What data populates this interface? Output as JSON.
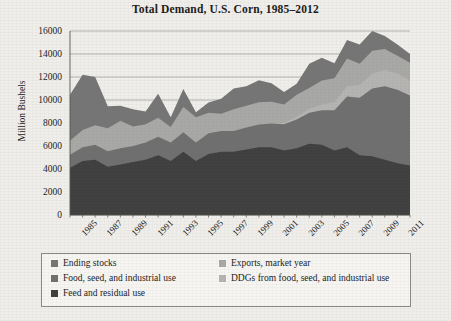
{
  "figure": {
    "title": "Total Demand, U.S. Corn, 1985–2012",
    "ylabel": "Million Bushels",
    "background_color": "#efeeea",
    "frame_color": "#8b8b86"
  },
  "chart_data": {
    "type": "area",
    "stacked": true,
    "title": "Total Demand, U.S. Corn, 1985–2012",
    "xlabel": "",
    "ylabel": "Million Bushels",
    "ylim": [
      0,
      16000
    ],
    "ytick_step": 2000,
    "yticks": [
      "0",
      "2000",
      "4000",
      "6000",
      "8000",
      "10000",
      "12000",
      "14000",
      "16000"
    ],
    "grid": "horizontal",
    "legend_position": "bottom",
    "legend_columns": 2,
    "x": [
      1985,
      1986,
      1987,
      1988,
      1989,
      1990,
      1991,
      1992,
      1993,
      1994,
      1995,
      1996,
      1997,
      1998,
      1999,
      2000,
      2001,
      2002,
      2003,
      2004,
      2005,
      2006,
      2007,
      2008,
      2009,
      2010,
      2011,
      2012
    ],
    "xticks": [
      "1985",
      "1987",
      "1989",
      "1991",
      "1993",
      "1995",
      "1997",
      "1999",
      "2001",
      "2003",
      "2005",
      "2007",
      "2009",
      "2011"
    ],
    "series": [
      {
        "name": "Feed and residual use",
        "color": "#3f3f3f",
        "stack_order": 1,
        "values": [
          4100,
          4700,
          4800,
          4200,
          4400,
          4600,
          4800,
          5200,
          4700,
          5500,
          4700,
          5300,
          5500,
          5500,
          5700,
          5900,
          5900,
          5600,
          5800,
          6200,
          6100,
          5600,
          5900,
          5200,
          5100,
          4800,
          4500,
          4300
        ]
      },
      {
        "name": "Food, seed, and industrial use",
        "color": "#6f6f6f",
        "stack_order": 2,
        "values": [
          1150,
          1200,
          1300,
          1350,
          1400,
          1400,
          1500,
          1600,
          1600,
          1700,
          1600,
          1800,
          1800,
          1800,
          1900,
          1960,
          2050,
          2300,
          2500,
          2700,
          3000,
          3500,
          4400,
          5000,
          5900,
          6400,
          6400,
          6100
        ]
      },
      {
        "name": "DDGs from food, seed, and industrial use",
        "color": "#b4b4b2",
        "stack_order": 3,
        "values": [
          0,
          0,
          0,
          0,
          0,
          0,
          0,
          0,
          0,
          0,
          0,
          0,
          0,
          0,
          0,
          0,
          0,
          100,
          250,
          350,
          500,
          700,
          900,
          1100,
          1300,
          1400,
          1400,
          1300
        ]
      },
      {
        "name": "Exports, market year",
        "color": "#a8a8a6",
        "stack_order": 4,
        "values": [
          1200,
          1500,
          1700,
          2000,
          2400,
          1700,
          1600,
          1650,
          1350,
          2200,
          2200,
          1800,
          1500,
          1900,
          1900,
          1950,
          1900,
          1600,
          1900,
          1800,
          2100,
          2100,
          2400,
          1850,
          1980,
          1830,
          1540,
          1540
        ]
      },
      {
        "name": "Ending stocks",
        "color": "#757575",
        "stack_order": 5,
        "values": [
          4000,
          4800,
          4200,
          1900,
          1300,
          1500,
          1100,
          2100,
          850,
          1550,
          425,
          880,
          1300,
          1800,
          1700,
          1900,
          1600,
          1100,
          960,
          2110,
          1970,
          1300,
          1620,
          1670,
          1710,
          1130,
          990,
          760
        ]
      }
    ]
  },
  "yticks": [
    {
      "label": "16000",
      "value": 16000
    },
    {
      "label": "14000",
      "value": 14000
    },
    {
      "label": "12000",
      "value": 12000
    },
    {
      "label": "10000",
      "value": 10000
    },
    {
      "label": "8000",
      "value": 8000
    },
    {
      "label": "6000",
      "value": 6000
    },
    {
      "label": "4000",
      "value": 4000
    },
    {
      "label": "2000",
      "value": 2000
    },
    {
      "label": "0",
      "value": 0
    }
  ],
  "xticks": [
    {
      "label": "1985"
    },
    {
      "label": "1987"
    },
    {
      "label": "1989"
    },
    {
      "label": "1991"
    },
    {
      "label": "1993"
    },
    {
      "label": "1995"
    },
    {
      "label": "1997"
    },
    {
      "label": "1999"
    },
    {
      "label": "2001"
    },
    {
      "label": "2003"
    },
    {
      "label": "2005"
    },
    {
      "label": "2007"
    },
    {
      "label": "2009"
    },
    {
      "label": "2011"
    }
  ],
  "legend": {
    "items": [
      {
        "label": "Ending stocks",
        "color": "#757575",
        "column": 0,
        "row": 0
      },
      {
        "label": "Exports, market year",
        "color": "#a8a8a6",
        "column": 1,
        "row": 0
      },
      {
        "label": "Food, seed, and industrial use",
        "color": "#6f6f6f",
        "column": 0,
        "row": 1
      },
      {
        "label": "DDGs from food, seed, and industrial use",
        "color": "#b4b4b2",
        "column": 1,
        "row": 1
      },
      {
        "label": "Feed and residual use",
        "color": "#3f3f3f",
        "column": 0,
        "row": 2
      }
    ]
  }
}
